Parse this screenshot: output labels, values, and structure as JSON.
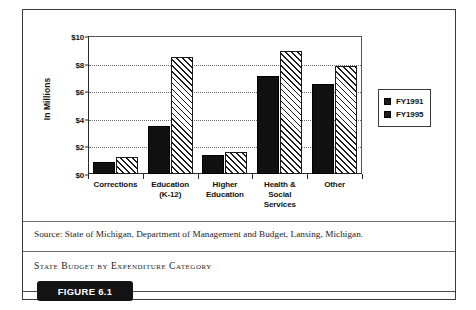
{
  "figure": {
    "badge_label": "FIGURE 6.1",
    "caption": "State Budget by Expenditure Category",
    "source": "Source: State of Michigan, Department of Management and Budget, Lansing, Michigan."
  },
  "chart_data": {
    "type": "bar",
    "title": "",
    "xlabel": "",
    "ylabel": "In Millions",
    "categories": [
      "Corrections",
      "Education (K-12)",
      "Higher Education",
      "Health & Social Services",
      "Other"
    ],
    "category_lines": [
      [
        "Corrections"
      ],
      [
        "Education",
        "(K-12)"
      ],
      [
        "Higher",
        "Education"
      ],
      [
        "Health &",
        "Social",
        "Services"
      ],
      [
        "Other"
      ]
    ],
    "series": [
      {
        "name": "FY1991",
        "values": [
          0.85,
          3.5,
          1.4,
          7.1,
          6.5
        ],
        "style": "solid",
        "color": "#111111"
      },
      {
        "name": "FY1995",
        "values": [
          1.2,
          8.5,
          1.6,
          8.95,
          7.85
        ],
        "style": "diagonal-hatch",
        "color": "#ffffff"
      }
    ],
    "ylim": [
      0,
      10
    ],
    "yticks": [
      0,
      2,
      4,
      6,
      8,
      10
    ],
    "ytick_labels": [
      "$0",
      "$2",
      "$4",
      "$6",
      "$8",
      "$10"
    ],
    "grid": "horizontal-dotted",
    "legend_position": "right"
  }
}
